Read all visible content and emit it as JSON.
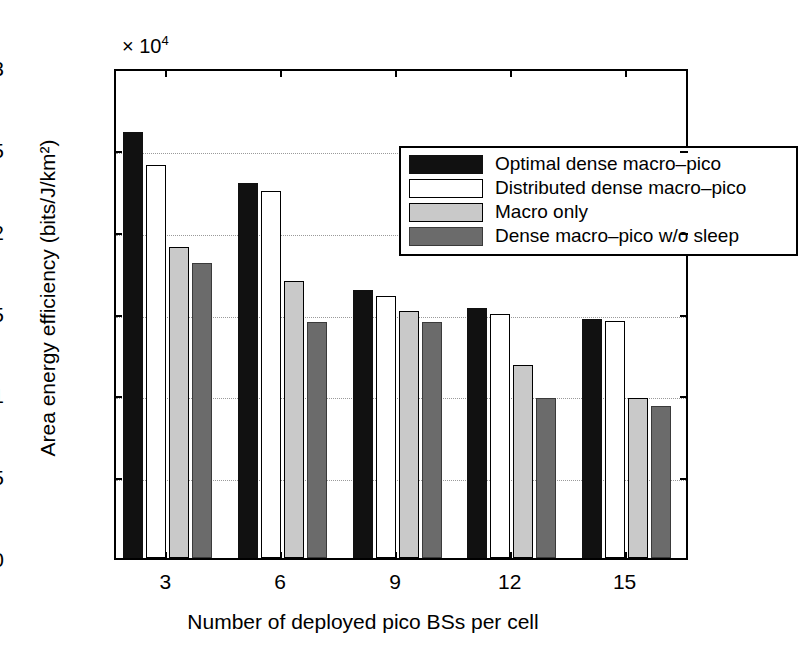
{
  "chart_data": {
    "type": "bar",
    "title": "",
    "xlabel": "Number of deployed pico BSs per cell",
    "ylabel": "Area energy efficiency (bits/J/km²)",
    "y_exponent_label": "× 10",
    "y_exponent_power": "4",
    "y_scale_factor": 10000,
    "categories": [
      "3",
      "6",
      "9",
      "12",
      "15"
    ],
    "ylim": [
      0,
      3
    ],
    "yticks": [
      "0",
      "0.5",
      "1",
      "1.5",
      "2",
      "2.5",
      "3"
    ],
    "ytick_values": [
      0,
      0.5,
      1,
      1.5,
      2,
      2.5,
      3
    ],
    "grid": "horizontal-dotted",
    "legend_position": "top-right-inside",
    "series": [
      {
        "name": "Optimal dense macro-pico",
        "color": "#111111",
        "values": [
          2.6,
          2.29,
          1.64,
          1.53,
          1.46
        ]
      },
      {
        "name": "Distributed dense macro-pico",
        "color": "#ffffff",
        "values": [
          2.4,
          2.24,
          1.6,
          1.49,
          1.45
        ]
      },
      {
        "name": "Macro only",
        "color": "#c9c9c9",
        "values": [
          1.9,
          1.69,
          1.51,
          1.18,
          0.98
        ]
      },
      {
        "name": "Dense macro-pico w/o sleep",
        "color": "#6b6b6b",
        "values": [
          1.8,
          1.44,
          1.44,
          0.98,
          0.93
        ]
      }
    ]
  }
}
